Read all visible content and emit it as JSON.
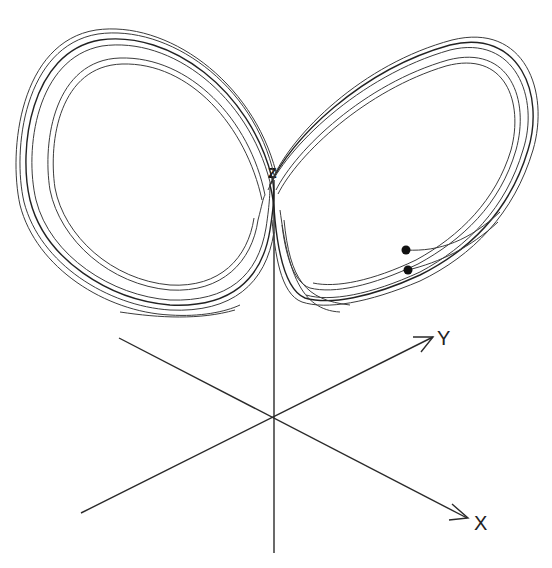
{
  "diagram": {
    "axes": {
      "x_label": "X",
      "y_label": "Y",
      "z_label": "Z"
    },
    "colors": {
      "background": "#ffffff",
      "stroke": "#2a2a2a",
      "points": "#111111"
    },
    "initial_points": [
      {
        "name": "start-point-1",
        "cx": 406,
        "cy": 250
      },
      {
        "name": "start-point-2",
        "cx": 408,
        "cy": 270
      }
    ]
  }
}
